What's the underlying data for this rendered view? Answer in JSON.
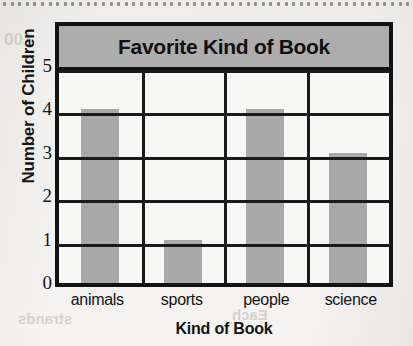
{
  "chart_data": {
    "type": "bar",
    "title": "Favorite Kind of Book",
    "xlabel": "Kind of Book",
    "ylabel": "Number of Children",
    "categories": [
      "animals",
      "sports",
      "people",
      "science"
    ],
    "values": [
      4,
      1,
      4,
      3
    ],
    "ylim": [
      0,
      5
    ],
    "yticks": [
      "0",
      "1",
      "2",
      "3",
      "4",
      "5"
    ],
    "grid": true,
    "legend": false,
    "colors": {
      "bar_fill": "#a9a9a9",
      "title_band": "#adadad",
      "plot_background": "#f7f7f5",
      "frame": "#131313",
      "gridline": "#1b1b1b",
      "text": "#121212",
      "page": "#f4f3f1"
    }
  },
  "page": {
    "bleed_through_text": [
      "100",
      "10.2",
      "picture graph",
      "tally",
      "classify",
      "table",
      "strands",
      "Each"
    ]
  }
}
